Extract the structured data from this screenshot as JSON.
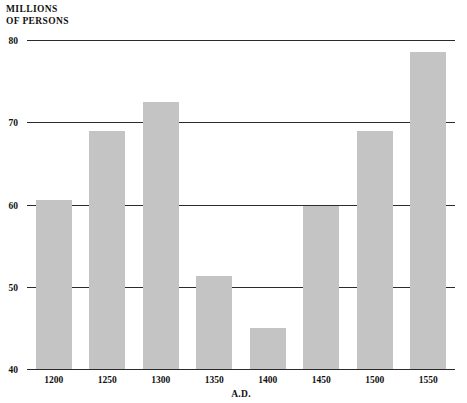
{
  "chart_data": {
    "type": "bar",
    "title_line1": "MILLIONS",
    "title_line2": "OF PERSONS",
    "xlabel": "A.D.",
    "ylabel": "MILLIONS OF PERSONS",
    "categories": [
      "1200",
      "1250",
      "1300",
      "1350",
      "1400",
      "1450",
      "1500",
      "1550"
    ],
    "values": [
      60.5,
      68.9,
      72.5,
      51.3,
      45.0,
      59.8,
      68.9,
      78.5
    ],
    "ylim": [
      40,
      80
    ],
    "yticks": [
      40,
      50,
      60,
      70,
      80
    ],
    "ytick_labels": [
      "40",
      "50",
      "60",
      "70",
      "80"
    ],
    "grid": true,
    "legend": null,
    "bar_color": "#c4c4c4",
    "axis_color": "#2b2b2b",
    "background": "#ffffff"
  }
}
